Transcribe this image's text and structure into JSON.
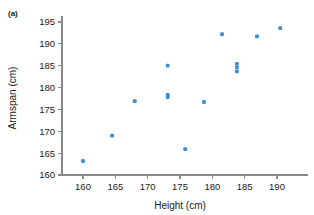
{
  "panel": {
    "label": "(a)"
  },
  "chart_data": {
    "type": "scatter",
    "title": "",
    "subtitle": "",
    "xlabel": "Height (cm)",
    "ylabel": "Armspan (cm)",
    "xlim": [
      157.5,
      192.5
    ],
    "ylim": [
      158.5,
      196.5
    ],
    "xticks": [
      160,
      165,
      170,
      175,
      180,
      185,
      190
    ],
    "yticks": [
      160,
      165,
      170,
      175,
      180,
      185,
      190,
      195
    ],
    "xtick_labels": [
      "160",
      "165",
      "170",
      "175",
      "180",
      "185",
      "190"
    ],
    "ytick_labels": [
      "160",
      "165",
      "170",
      "175",
      "180",
      "185",
      "190",
      "195"
    ],
    "grid": false,
    "legend": null,
    "marker_color": "#3b8fd4",
    "axis_color": "#8a8a8a",
    "n_points": 14,
    "x": [
      160.0,
      164.5,
      168.0,
      173.1,
      173.1,
      173.1,
      175.8,
      178.7,
      181.5,
      183.8,
      183.8,
      183.8,
      186.9,
      190.5
    ],
    "y": [
      163.2,
      169.0,
      176.9,
      185.0,
      178.3,
      177.8,
      165.9,
      176.7,
      192.2,
      185.4,
      184.6,
      183.7,
      191.7,
      193.6
    ],
    "points": [
      {
        "x": 160.0,
        "y": 163.2
      },
      {
        "x": 164.5,
        "y": 169.0
      },
      {
        "x": 168.0,
        "y": 176.9
      },
      {
        "x": 173.1,
        "y": 185.0
      },
      {
        "x": 173.1,
        "y": 178.3
      },
      {
        "x": 173.1,
        "y": 177.8
      },
      {
        "x": 175.8,
        "y": 165.9
      },
      {
        "x": 178.7,
        "y": 176.7
      },
      {
        "x": 181.5,
        "y": 192.2
      },
      {
        "x": 183.8,
        "y": 185.4
      },
      {
        "x": 183.8,
        "y": 184.6
      },
      {
        "x": 183.8,
        "y": 183.7
      },
      {
        "x": 186.9,
        "y": 191.7
      },
      {
        "x": 190.5,
        "y": 193.6
      }
    ]
  }
}
